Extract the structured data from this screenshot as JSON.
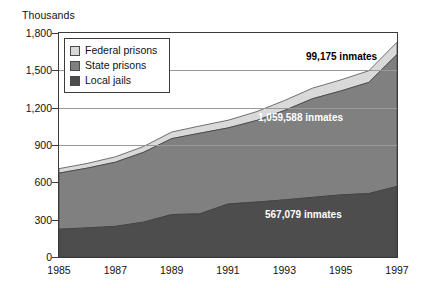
{
  "chart_data": {
    "type": "area",
    "stacked": true,
    "title": "",
    "subtitle": "",
    "xlabel": "",
    "ylabel": "Thousands",
    "ylim": [
      0,
      1800
    ],
    "yticks": [
      0,
      300,
      600,
      900,
      1200,
      1500,
      1800
    ],
    "ytick_labels": [
      "0",
      "300",
      "600",
      "900",
      "1,200",
      "1,500",
      "1,800"
    ],
    "grid": true,
    "gridlines_at": [
      900,
      1200,
      1500
    ],
    "legend_position": "upper-left-inside",
    "x": [
      1985,
      1986,
      1987,
      1988,
      1989,
      1990,
      1991,
      1992,
      1993,
      1994,
      1995,
      1996,
      1997
    ],
    "xtick_labels": [
      "1985",
      "1987",
      "1989",
      "1991",
      "1993",
      "1995",
      "1997"
    ],
    "xticks": [
      1985,
      1987,
      1989,
      1991,
      1993,
      1995,
      1997
    ],
    "series": [
      {
        "name": "Local jails",
        "color": "#4d4d4d",
        "values": [
          223,
          234,
          246,
          280,
          341,
          347,
          426,
          441,
          459,
          479,
          499,
          510,
          567
        ]
      },
      {
        "name": "State prisons",
        "color": "#808080",
        "values": [
          451,
          480,
          516,
          561,
          610,
          648,
          611,
          655,
          718,
          793,
          835,
          893,
          1060
        ]
      },
      {
        "name": "Federal prisons",
        "color": "#d9d9d9",
        "values": [
          36,
          38,
          43,
          47,
          53,
          58,
          62,
          71,
          80,
          85,
          89,
          94,
          99
        ]
      }
    ],
    "annotations": [
      {
        "id": "federal-annotation",
        "text": "99,175 inmates",
        "series": "Federal prisons",
        "style": "dark"
      },
      {
        "id": "state-annotation",
        "text": "1,059,588 inmates",
        "series": "State prisons",
        "style": "light"
      },
      {
        "id": "local-annotation",
        "text": "567,079 inmates",
        "series": "Local jails",
        "style": "light"
      }
    ],
    "legend_entries": [
      {
        "label": "Federal prisons",
        "color": "#d9d9d9"
      },
      {
        "label": "State prisons",
        "color": "#808080"
      },
      {
        "label": "Local jails",
        "color": "#4d4d4d"
      }
    ]
  }
}
